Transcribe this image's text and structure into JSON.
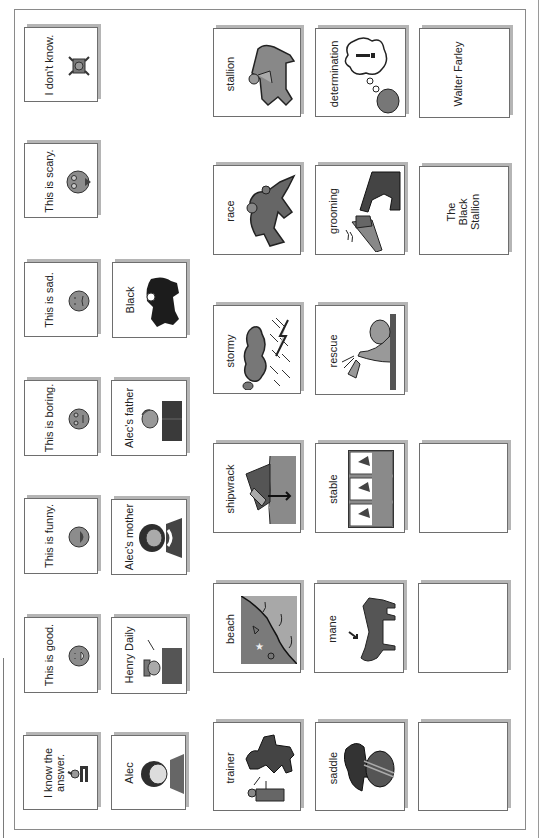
{
  "board": {
    "orientation": "rotated-90-ccw",
    "feelings": [
      {
        "id": "dont-know",
        "label": "I don't know.",
        "icon": "shrug-person-icon"
      },
      {
        "id": "scary",
        "label": "This is scary.",
        "icon": "scared-face-icon"
      },
      {
        "id": "sad",
        "label": "This is sad.",
        "icon": "sad-face-icon"
      },
      {
        "id": "boring",
        "label": "This is boring.",
        "icon": "bored-face-icon"
      },
      {
        "id": "funny",
        "label": "This is funny.",
        "icon": "laughing-face-icon"
      },
      {
        "id": "good",
        "label": "This is good.",
        "icon": "happy-face-icon"
      },
      {
        "id": "know-answer",
        "label": "I know the answer.",
        "icon": "raised-hand-person-icon"
      }
    ],
    "characters": [
      {
        "id": "black",
        "label": "Black",
        "icon": "black-horse-icon"
      },
      {
        "id": "alecs-father",
        "label": "Alec's father",
        "icon": "man-portrait-icon"
      },
      {
        "id": "alecs-mother",
        "label": "Alec's mother",
        "icon": "woman-portrait-icon"
      },
      {
        "id": "henry-daily",
        "label": "Henry Daily",
        "icon": "man-with-hat-icon"
      },
      {
        "id": "alec",
        "label": "Alec",
        "icon": "boy-portrait-icon"
      }
    ],
    "vocab_col1": [
      {
        "id": "stallion",
        "label": "stallion",
        "icon": "horse-rider-icon"
      },
      {
        "id": "race",
        "label": "race",
        "icon": "racing-horse-icon"
      },
      {
        "id": "stormy",
        "label": "stormy",
        "icon": "storm-cloud-icon"
      },
      {
        "id": "shipwrack",
        "label": "shipwrack",
        "icon": "sinking-ship-icon"
      },
      {
        "id": "beach",
        "label": "beach",
        "icon": "beach-shore-icon"
      },
      {
        "id": "trainer",
        "label": "trainer",
        "icon": "trainer-horse-icon"
      }
    ],
    "vocab_col2": [
      {
        "id": "determination",
        "label": "determination",
        "icon": "thought-bubble-icon"
      },
      {
        "id": "grooming",
        "label": "grooming",
        "icon": "brush-horse-icon"
      },
      {
        "id": "rescue",
        "label": "rescue",
        "icon": "reaching-hand-icon"
      },
      {
        "id": "stable",
        "label": "stable",
        "icon": "horse-stalls-icon"
      },
      {
        "id": "mane",
        "label": "mane",
        "icon": "horse-mane-icon"
      },
      {
        "id": "saddle",
        "label": "saddle",
        "icon": "saddle-icon"
      }
    ],
    "book_info": [
      {
        "id": "author",
        "label": "Walter Farley"
      },
      {
        "id": "title",
        "label": "The Black Stallion"
      },
      {
        "id": "blank-1",
        "label": ""
      },
      {
        "id": "blank-2",
        "label": ""
      },
      {
        "id": "blank-3",
        "label": ""
      }
    ]
  },
  "colors": {
    "card_border": "#6e6e6e",
    "card_shadow": "#b5b5b5",
    "icon_fill": "#8c8c8c",
    "icon_dark": "#333333"
  }
}
